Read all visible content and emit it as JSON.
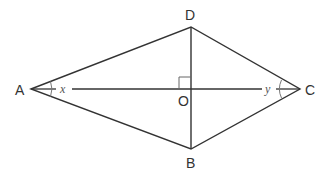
{
  "diagram": {
    "type": "rhombus-with-diagonals",
    "stroke_color": "#333333",
    "arc_color": "#777777",
    "vertices": {
      "A": {
        "label": "A",
        "x": 31,
        "y": 89
      },
      "B": {
        "label": "B",
        "x": 191,
        "y": 149
      },
      "C": {
        "label": "C",
        "x": 300,
        "y": 89
      },
      "D": {
        "label": "D",
        "x": 191,
        "y": 27
      },
      "O": {
        "label": "O",
        "x": 191,
        "y": 89
      }
    },
    "angles": {
      "x": {
        "label": "x",
        "at": "A"
      },
      "y": {
        "label": "y",
        "at": "C"
      }
    },
    "right_angle_marker": {
      "at": "O"
    }
  }
}
